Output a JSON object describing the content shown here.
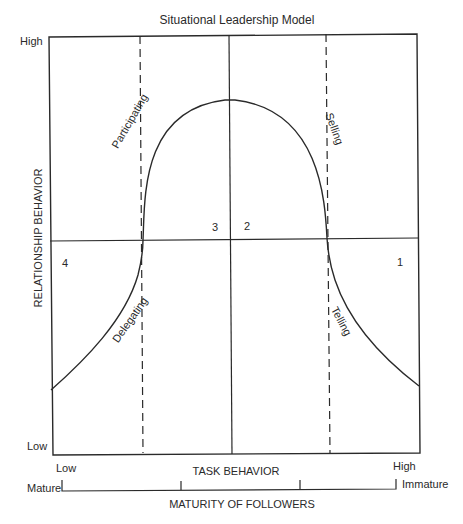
{
  "title": "Situational Leadership Model",
  "y_axis": {
    "label": "RELATIONSHIP BEHAVIOR",
    "high": "High",
    "low": "Low"
  },
  "x_axis": {
    "label": "TASK BEHAVIOR",
    "low": "Low",
    "high": "High"
  },
  "maturity_scale": {
    "label": "MATURITY OF FOLLOWERS",
    "left": "Mature",
    "right": "Immature"
  },
  "quadrants": [
    {
      "number": "1",
      "style": "Telling"
    },
    {
      "number": "2",
      "style": "Selling"
    },
    {
      "number": "3",
      "style": "Participating"
    },
    {
      "number": "4",
      "style": "Delegating"
    }
  ],
  "colors": {
    "line": "#2a2a2a",
    "background": "#ffffff"
  }
}
